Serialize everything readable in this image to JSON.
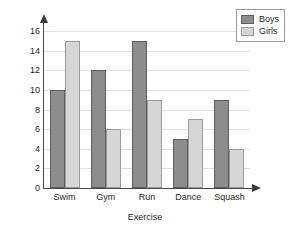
{
  "chart_data": {
    "type": "bar",
    "title": "",
    "xlabel": "Exercise",
    "ylabel": "Number of students",
    "categories": [
      "Swim",
      "Gym",
      "Run",
      "Dance",
      "Squash"
    ],
    "series": [
      {
        "name": "Boys",
        "color": "#8d8d8d",
        "values": [
          10,
          12,
          15,
          5,
          9
        ]
      },
      {
        "name": "Girls",
        "color": "#d6d6d6",
        "values": [
          15,
          6,
          9,
          7,
          4
        ]
      }
    ],
    "ylim": [
      0,
      16
    ],
    "ytick_step": 2,
    "yticks": [
      0,
      2,
      4,
      6,
      8,
      10,
      12,
      14,
      16
    ],
    "grid": true,
    "grid_axis": "y",
    "legend_position": "top-right",
    "legend_entries": [
      "Boys",
      "Girls"
    ]
  },
  "legend": {
    "boys_label": "Boys",
    "girls_label": "Girls"
  },
  "axes": {
    "y_title": "Number of students",
    "x_title": "Exercise"
  }
}
